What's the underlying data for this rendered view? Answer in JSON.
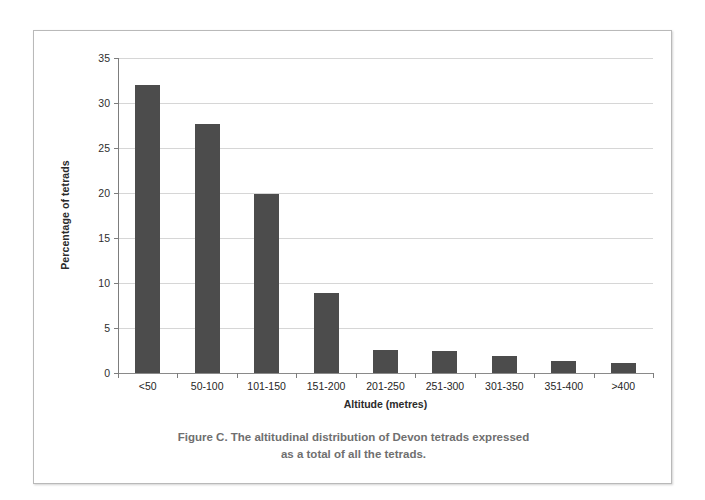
{
  "chart_data": {
    "type": "bar",
    "title": "",
    "xlabel": "Altitude (metres)",
    "ylabel": "Percentage of tetrads",
    "categories": [
      "<50",
      "50-100",
      "101-150",
      "151-200",
      "201-250",
      "251-300",
      "301-350",
      "351-400",
      ">400"
    ],
    "values": [
      32.0,
      27.7,
      19.9,
      8.9,
      2.55,
      2.5,
      1.9,
      1.3,
      1.1
    ],
    "ylim": [
      0,
      35
    ],
    "yticks": [
      0,
      5,
      10,
      15,
      20,
      25,
      30,
      35
    ],
    "ytick_labels": [
      "0",
      "5",
      "10",
      "15",
      "20",
      "25",
      "30",
      "35"
    ],
    "grid": true,
    "legend": false,
    "series_color": "#4c4c4c"
  },
  "axes": {
    "y_title": "Percentage of tetrads",
    "x_title": "Altitude (metres)"
  },
  "caption": {
    "line1": "Figure C. The altitudinal distribution of Devon tetrads expressed",
    "line2": "as a total of all the tetrads."
  },
  "colors": {
    "bar": "#4c4c4c",
    "gridline": "#d6d6d6",
    "axis": "#7d7d7d",
    "caption_text": "#6f6f6f",
    "frame": "#b9b9b9",
    "page_background": "#ffffff"
  }
}
